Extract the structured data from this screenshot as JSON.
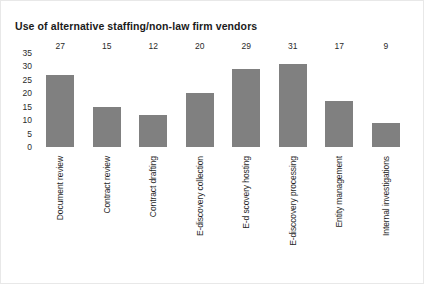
{
  "chart_data": {
    "type": "bar",
    "title": "Use of alternative staffing/non-law firm vendors",
    "xlabel": "",
    "ylabel": "",
    "ylim": [
      0,
      35
    ],
    "yticks": [
      "35",
      "30",
      "25",
      "20",
      "15",
      "10",
      "5",
      "0"
    ],
    "grid": false,
    "legend": "none",
    "bar_color": "#808080",
    "orientation": "vertical",
    "value_labels": true,
    "category_label_rotation": -90,
    "categories": [
      "Document review",
      "Contract review",
      "Contract drafting",
      "E-discovery collection",
      "E-d scovery hosting",
      "E-disccovery processing",
      "Entity management",
      "Internal investigations"
    ],
    "values": [
      27,
      15,
      12,
      20,
      29,
      31,
      17,
      9
    ],
    "bars": [
      {
        "label": "Document review",
        "value": 27,
        "value_label": "27"
      },
      {
        "label": "Contract review",
        "value": 15,
        "value_label": "15"
      },
      {
        "label": "Contract drafting",
        "value": 12,
        "value_label": "12"
      },
      {
        "label": "E-discovery collection",
        "value": 20,
        "value_label": "20"
      },
      {
        "label": "E-d scovery hosting",
        "value": 29,
        "value_label": "29"
      },
      {
        "label": "E-disccovery processing",
        "value": 31,
        "value_label": "31"
      },
      {
        "label": "Entity management",
        "value": 17,
        "value_label": "17"
      },
      {
        "label": "Internal investigations",
        "value": 9,
        "value_label": "9"
      }
    ]
  }
}
